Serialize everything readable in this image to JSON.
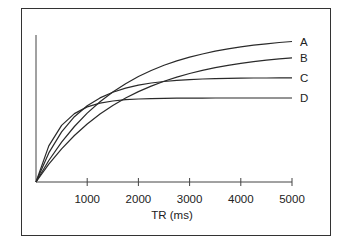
{
  "chart_data": {
    "type": "line",
    "title": "",
    "xlabel": "TR (ms)",
    "ylabel": "",
    "xlim": [
      0,
      5000
    ],
    "ylim": [
      0,
      150
    ],
    "grid": false,
    "legend_position": "inline-right",
    "x_ticks": [
      1000,
      2000,
      3000,
      4000,
      5000
    ],
    "x": [
      0,
      250,
      500,
      750,
      1000,
      1250,
      1500,
      1750,
      2000,
      2250,
      2500,
      2750,
      3000,
      3250,
      3500,
      3750,
      4000,
      4250,
      4500,
      4750,
      5000
    ],
    "series": [
      {
        "name": "A",
        "values": [
          0,
          21.5,
          39.8,
          55.5,
          68.9,
          80.3,
          90.0,
          98.3,
          105.5,
          111.5,
          116.7,
          121.1,
          124.8,
          128.0,
          130.8,
          133.1,
          135.1,
          136.8,
          138.2,
          139.5,
          140.5
        ]
      },
      {
        "name": "B",
        "values": [
          0,
          17.8,
          33.2,
          46.5,
          58.0,
          68.0,
          76.6,
          84.0,
          90.4,
          95.9,
          100.7,
          104.9,
          108.5,
          111.6,
          114.3,
          116.6,
          118.6,
          120.3,
          121.8,
          123.1,
          124.2
        ]
      },
      {
        "name": "C",
        "values": [
          0,
          29.1,
          50.1,
          65.3,
          76.2,
          84.1,
          89.8,
          93.9,
          96.8,
          99.0,
          100.5,
          101.6,
          102.4,
          103.0,
          103.4,
          103.7,
          103.8,
          104.0,
          104.0,
          104.1,
          104.1
        ]
      },
      {
        "name": "D",
        "values": [
          0,
          36.1,
          56.6,
          68.4,
          75.1,
          78.9,
          81.0,
          82.3,
          83.0,
          83.4,
          83.7,
          83.8,
          83.9,
          83.9,
          84.0,
          84.0,
          84.0,
          84.0,
          84.0,
          84.0,
          84.0
        ]
      }
    ],
    "colors": {
      "line": "#2a2a2a",
      "axis": "#444444",
      "frame": "#333333"
    }
  }
}
